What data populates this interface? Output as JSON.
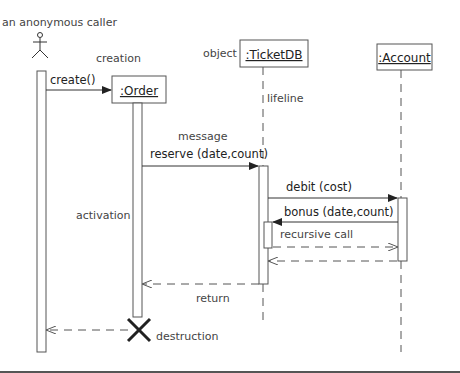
{
  "diagram": {
    "type": "UML sequence diagram",
    "actor": {
      "label": "an anonymous caller"
    },
    "annotations": {
      "creation": "creation",
      "object": "object",
      "lifeline": "lifeline",
      "message": "message",
      "activation": "activation",
      "recursive_call": "recursive call",
      "return": "return",
      "destruction": "destruction"
    },
    "objects": [
      {
        "name": ":Order"
      },
      {
        "name": ":TicketDB"
      },
      {
        "name": ":Account"
      }
    ],
    "messages": [
      {
        "from": "caller",
        "to": ":Order",
        "label": "create()",
        "style": "solid"
      },
      {
        "from": ":Order",
        "to": ":TicketDB",
        "label": "reserve (date,count)",
        "style": "solid"
      },
      {
        "from": ":TicketDB",
        "to": ":Account",
        "label": "debit (cost)",
        "style": "solid"
      },
      {
        "from": ":Account",
        "to": ":TicketDB",
        "label": "bonus (date,count)",
        "style": "solid"
      },
      {
        "from": ":TicketDB",
        "to": ":Account",
        "label": "",
        "style": "dashed-return"
      },
      {
        "from": ":Account",
        "to": ":TicketDB",
        "label": "",
        "style": "dashed-return"
      },
      {
        "from": ":TicketDB",
        "to": ":Order",
        "label": "",
        "style": "dashed-return"
      },
      {
        "from": ":Order",
        "to": "caller",
        "label": "",
        "style": "dashed-return"
      }
    ]
  }
}
